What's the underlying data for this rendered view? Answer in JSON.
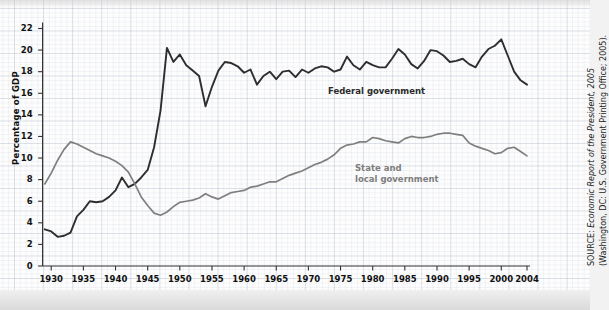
{
  "chart_data": {
    "type": "line",
    "title": "",
    "subtitle": "",
    "xlabel": "",
    "ylabel": "Percentage of GDP",
    "xlim": [
      1929,
      2004
    ],
    "ylim": [
      0,
      23
    ],
    "yticks": [
      0,
      2,
      4,
      6,
      8,
      10,
      12,
      14,
      16,
      18,
      20,
      22
    ],
    "xticks": [
      1930,
      1935,
      1940,
      1945,
      1950,
      1955,
      1960,
      1965,
      1970,
      1975,
      1980,
      1985,
      1990,
      1995,
      2000,
      2004
    ],
    "grid": true,
    "legend_position": "inline-labels",
    "x": [
      1929,
      1930,
      1931,
      1932,
      1933,
      1934,
      1935,
      1936,
      1937,
      1938,
      1939,
      1940,
      1941,
      1942,
      1943,
      1944,
      1945,
      1946,
      1947,
      1948,
      1949,
      1950,
      1951,
      1952,
      1953,
      1954,
      1955,
      1956,
      1957,
      1958,
      1959,
      1960,
      1961,
      1962,
      1963,
      1964,
      1965,
      1966,
      1967,
      1968,
      1969,
      1970,
      1971,
      1972,
      1973,
      1974,
      1975,
      1976,
      1977,
      1978,
      1979,
      1980,
      1981,
      1982,
      1983,
      1984,
      1985,
      1986,
      1987,
      1988,
      1989,
      1990,
      1991,
      1992,
      1993,
      1994,
      1995,
      1996,
      1997,
      1998,
      1999,
      2000,
      2001,
      2002,
      2003,
      2004
    ],
    "series": [
      {
        "name": "Federal government",
        "color": "#2e2e2e",
        "values": [
          3.4,
          3.2,
          2.7,
          2.8,
          3.1,
          4.6,
          5.2,
          6.0,
          5.9,
          6.0,
          6.4,
          7.0,
          8.2,
          7.3,
          7.6,
          8.2,
          8.9,
          11.0,
          14.4,
          20.2,
          18.9,
          19.6,
          18.6,
          18.1,
          17.6,
          14.8,
          16.6,
          18.1,
          18.9,
          18.8,
          18.5,
          17.9,
          18.2,
          16.8,
          17.6,
          18.0,
          17.3,
          18.0,
          18.1,
          17.5,
          18.2,
          17.9,
          18.3,
          18.5,
          18.4,
          18.0,
          18.2,
          19.4,
          18.6,
          18.2,
          18.9,
          18.6,
          18.4,
          18.4,
          19.2,
          20.1,
          19.6,
          18.7,
          18.3,
          19.0,
          20.0,
          19.9,
          19.5,
          18.9,
          19.0,
          19.2,
          18.7,
          18.4,
          19.4,
          20.1,
          20.4,
          21.0,
          19.5,
          18.0,
          17.2,
          16.8
        ]
      },
      {
        "name": "State and local government",
        "color": "#7f7f7f",
        "values": [
          7.6,
          8.6,
          9.8,
          10.8,
          11.5,
          11.3,
          11.0,
          10.7,
          10.4,
          10.2,
          10.0,
          9.7,
          9.3,
          8.7,
          7.6,
          6.4,
          5.6,
          4.9,
          4.7,
          5.0,
          5.5,
          5.9,
          6.0,
          6.1,
          6.3,
          6.7,
          6.4,
          6.2,
          6.5,
          6.8,
          6.9,
          7.0,
          7.3,
          7.4,
          7.6,
          7.8,
          7.8,
          8.1,
          8.4,
          8.6,
          8.8,
          9.1,
          9.4,
          9.6,
          9.9,
          10.3,
          10.9,
          11.2,
          11.3,
          11.5,
          11.5,
          11.9,
          11.8,
          11.6,
          11.5,
          11.4,
          11.8,
          12.0,
          11.9,
          11.9,
          12.0,
          12.2,
          12.3,
          12.3,
          12.2,
          12.1,
          11.4,
          11.1,
          10.9,
          10.7,
          10.4,
          10.5,
          10.9,
          11.0,
          10.6,
          10.2
        ]
      }
    ]
  },
  "labels": {
    "federal": "Federal government",
    "state_local_line1": "State and",
    "state_local_line2": "local government",
    "ylabel": "Percentage of GDP"
  },
  "source": {
    "prefix": "SOURCE: ",
    "italic": "Economic Report of the President, 2005",
    "suffix": " (Washington, DC: U.S. Government Printing Office; 2005)."
  },
  "colors": {
    "federal_line": "#2e2e2e",
    "state_local_line": "#7f7f7f",
    "axis": "#333333",
    "grid": "#8c9bb4",
    "background": "#f2f2f2",
    "plot_background": "#fdfdfd"
  }
}
